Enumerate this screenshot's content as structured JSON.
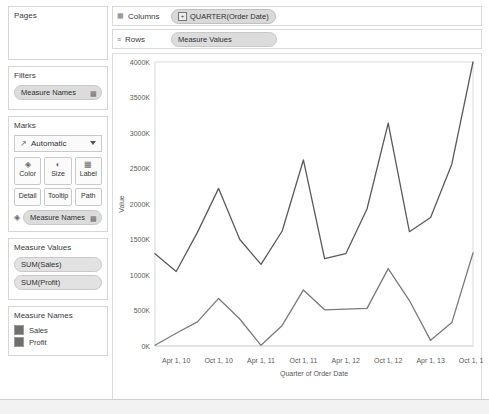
{
  "sidebar": {
    "pages": {
      "title": "Pages"
    },
    "filters": {
      "title": "Filters",
      "items": [
        {
          "label": "Measure Names",
          "icon": "bar-chart-icon"
        }
      ]
    },
    "marks": {
      "title": "Marks",
      "type": "Automatic",
      "type_icon": "line-chart-icon",
      "buttons": [
        {
          "label": "Color",
          "icon": "color-icon"
        },
        {
          "label": "Size",
          "icon": "size-icon"
        },
        {
          "label": "Label",
          "icon": "label-icon"
        },
        {
          "label": "Detail",
          "icon": "detail-icon"
        },
        {
          "label": "Tooltip",
          "icon": "tooltip-icon"
        },
        {
          "label": "Path",
          "icon": "path-icon"
        }
      ],
      "encoding_pill": {
        "label": "Measure Names",
        "icon": "color-icon",
        "end_icon": "bar-chart-icon"
      }
    },
    "measure_values": {
      "title": "Measure Values",
      "items": [
        "SUM(Sales)",
        "SUM(Profit)"
      ]
    },
    "measure_names": {
      "title": "Measure Names",
      "items": [
        {
          "label": "Sales",
          "color": "#707070"
        },
        {
          "label": "Profit",
          "color": "#6e6e6e"
        }
      ]
    }
  },
  "shelves": {
    "columns": {
      "label": "Columns",
      "icon": "columns-icon",
      "pill": "QUARTER(Order Date)",
      "expander": "+"
    },
    "rows": {
      "label": "Rows",
      "icon": "rows-icon",
      "pill": "Measure Values"
    }
  },
  "chart_data": {
    "type": "line",
    "title": "",
    "xlabel": "Quarter of Order Date",
    "ylabel": "Value",
    "grid": false,
    "legend_position": "sidebar",
    "ylim": [
      0,
      4000
    ],
    "ytick_labels": [
      "0K",
      "500K",
      "1000K",
      "1500K",
      "2000K",
      "2500K",
      "3000K",
      "3500K",
      "4000K"
    ],
    "ytick_values": [
      0,
      500,
      1000,
      1500,
      2000,
      2500,
      3000,
      3500,
      4000
    ],
    "xtick_labels": [
      "Apr 1, 10",
      "Oct 1, 10",
      "Apr 1, 11",
      "Oct 1, 11",
      "Apr 1, 12",
      "Oct 1, 12",
      "Apr 1, 13",
      "Oct 1, 13"
    ],
    "x": [
      "Jan 1, 10",
      "Apr 1, 10",
      "Jul 1, 10",
      "Oct 1, 10",
      "Jan 1, 11",
      "Apr 1, 11",
      "Jul 1, 11",
      "Oct 1, 11",
      "Jan 1, 12",
      "Apr 1, 12",
      "Jul 1, 12",
      "Oct 1, 12",
      "Jan 1, 13",
      "Apr 1, 13",
      "Jul 1, 13",
      "Oct 1, 13"
    ],
    "series": [
      {
        "name": "Sales",
        "color": "#5a5a5a",
        "values": [
          1300,
          1050,
          1600,
          2220,
          1500,
          1150,
          1620,
          2620,
          1230,
          1300,
          1930,
          3140,
          1610,
          1810,
          2560,
          4000
        ]
      },
      {
        "name": "Profit",
        "color": "#7a7a7a",
        "values": [
          10,
          180,
          340,
          670,
          380,
          10,
          290,
          790,
          510,
          520,
          530,
          1090,
          640,
          80,
          330,
          1310
        ]
      }
    ]
  },
  "statusbar": {
    "text": ""
  }
}
